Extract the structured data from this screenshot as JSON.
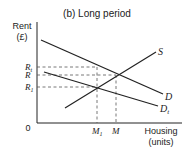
{
  "title": "(b) Long period",
  "axes": {
    "y_label_line1": "Rent",
    "y_label_line2": "(£)",
    "x_label_line1": "Housing",
    "x_label_line2": "(units)",
    "origin": "0"
  },
  "curves": {
    "supply": {
      "label": "S"
    },
    "demand": {
      "label": "D"
    },
    "demand_t": {
      "label": "D",
      "sub": "t"
    }
  },
  "y_levels": {
    "rt": {
      "label": "R",
      "sub": "t"
    },
    "r": {
      "label": "R",
      "sub": ""
    },
    "r1": {
      "label": "R",
      "sub": "1"
    }
  },
  "x_levels": {
    "m1": {
      "label": "M",
      "sub": "1"
    },
    "m": {
      "label": "M",
      "sub": ""
    }
  },
  "colors": {
    "line": "#222222",
    "dashed": "#555555",
    "background": "#ffffff"
  }
}
